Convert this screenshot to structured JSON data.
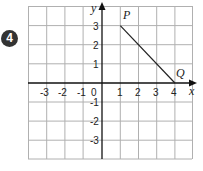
{
  "question": {
    "number": "4"
  },
  "graph": {
    "x_axis_label": "x",
    "y_axis_label": "y",
    "origin_label": "0",
    "x_ticks": [
      "-3",
      "-2",
      "-1",
      "1",
      "2",
      "3",
      "4"
    ],
    "y_ticks": [
      "3",
      "2",
      "1",
      "-1",
      "-2",
      "-3"
    ],
    "points": [
      {
        "label": "P",
        "x": 1,
        "y": 3
      },
      {
        "label": "Q",
        "x": 4,
        "y": 0
      }
    ],
    "x_range": [
      -4,
      5
    ],
    "y_range": [
      -4,
      4
    ],
    "colors": {
      "grid": "#b0b0b0",
      "axis": "#111111",
      "segment": "#222222"
    }
  }
}
